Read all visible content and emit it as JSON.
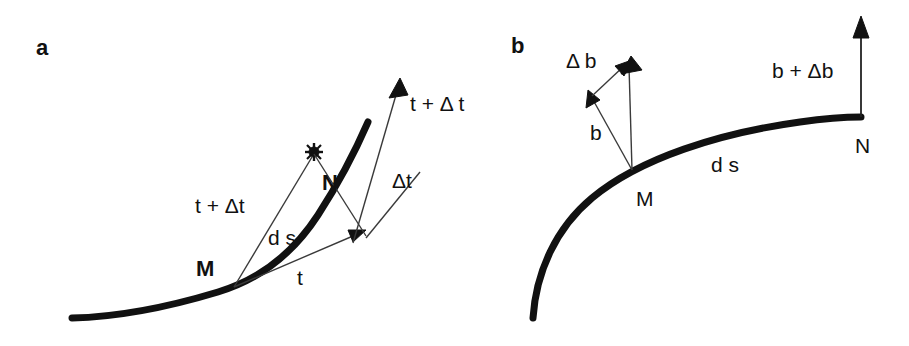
{
  "figure": {
    "width": 909,
    "height": 346,
    "background_color": "#ffffff",
    "ink_color": "#111111",
    "thin_line_color": "#3a3a3a"
  },
  "panels": [
    {
      "id": "panel-a",
      "letter": "a",
      "description": "Tangent vector t at point M and t + delta t at point N along a curve",
      "labels": {
        "point_m": "M",
        "point_n": "N",
        "vector_t": "t",
        "vector_t_plus_dt_left": "t + Δt",
        "vector_t_plus_dt_right": "t + Δ t",
        "vector_delta_t": "Δt",
        "arc_length": "d s"
      }
    },
    {
      "id": "panel-b",
      "letter": "b",
      "description": "Binormal vector b at point M and b + delta b at point N along a curve",
      "labels": {
        "point_m": "M",
        "point_n": "N",
        "vector_b": "b",
        "vector_delta_b": "Δ b",
        "vector_b_plus_db": "b + Δb",
        "arc_length": "d s"
      }
    }
  ]
}
